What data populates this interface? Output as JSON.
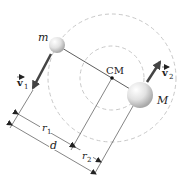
{
  "diagram": {
    "type": "binary-system-center-of-mass",
    "labels": {
      "small_mass": "m",
      "large_mass": "M",
      "center_of_mass": "CM",
      "velocity_1": "v",
      "velocity_1_sub": "1",
      "velocity_2": "v",
      "velocity_2_sub": "2",
      "radius_1": "r",
      "radius_1_sub": "1",
      "radius_2": "r",
      "radius_2_sub": "2",
      "separation": "d"
    },
    "colors": {
      "sphere_light": "#f2f2f2",
      "sphere_dark": "#b5b5b5",
      "orbit_dashed": "#c8c8c8",
      "lines": "#333333",
      "arrow": "#444444"
    }
  }
}
